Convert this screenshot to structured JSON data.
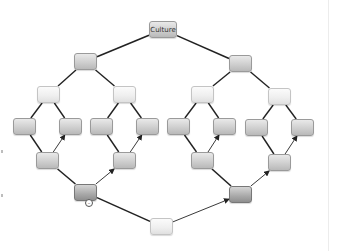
{
  "diagram": {
    "type": "tree",
    "root": {
      "id": "culture",
      "label": "Culture"
    },
    "nodes": [
      {
        "id": "culture",
        "label": "Culture",
        "x": 149,
        "y": 21,
        "style": "root"
      },
      {
        "id": "l1a",
        "label": "",
        "x": 74,
        "y": 53,
        "style": "normal"
      },
      {
        "id": "l1b",
        "label": "",
        "x": 229,
        "y": 55,
        "style": "normal"
      },
      {
        "id": "l2a",
        "label": "",
        "x": 37,
        "y": 86,
        "style": "light"
      },
      {
        "id": "l2b",
        "label": "",
        "x": 113,
        "y": 86,
        "style": "light"
      },
      {
        "id": "l2c",
        "label": "",
        "x": 191,
        "y": 86,
        "style": "light"
      },
      {
        "id": "l2d",
        "label": "",
        "x": 268,
        "y": 88,
        "style": "light"
      },
      {
        "id": "l3a",
        "label": "",
        "x": 13,
        "y": 118,
        "style": "normal"
      },
      {
        "id": "l3b",
        "label": "",
        "x": 59,
        "y": 118,
        "style": "normal"
      },
      {
        "id": "l3c",
        "label": "",
        "x": 90,
        "y": 118,
        "style": "normal"
      },
      {
        "id": "l3d",
        "label": "",
        "x": 136,
        "y": 118,
        "style": "normal"
      },
      {
        "id": "l3e",
        "label": "",
        "x": 167,
        "y": 118,
        "style": "normal"
      },
      {
        "id": "l3f",
        "label": "",
        "x": 213,
        "y": 118,
        "style": "normal"
      },
      {
        "id": "l3g",
        "label": "",
        "x": 245,
        "y": 119,
        "style": "normal"
      },
      {
        "id": "l3h",
        "label": "",
        "x": 291,
        "y": 119,
        "style": "normal"
      },
      {
        "id": "l4a",
        "label": "",
        "x": 36,
        "y": 152,
        "style": "normal"
      },
      {
        "id": "l4b",
        "label": "",
        "x": 113,
        "y": 152,
        "style": "normal"
      },
      {
        "id": "l4c",
        "label": "",
        "x": 191,
        "y": 152,
        "style": "normal"
      },
      {
        "id": "l4d",
        "label": "",
        "x": 268,
        "y": 154,
        "style": "normal"
      },
      {
        "id": "l5a",
        "label": "",
        "x": 74,
        "y": 184,
        "style": "dark"
      },
      {
        "id": "l5b",
        "label": "",
        "x": 229,
        "y": 186,
        "style": "dark"
      },
      {
        "id": "bottom",
        "label": "",
        "x": 150,
        "y": 218,
        "style": "light"
      }
    ],
    "edges": [
      {
        "from": "culture",
        "to": "l1a",
        "arrow": false,
        "weight": 1.6
      },
      {
        "from": "culture",
        "to": "l1b",
        "arrow": false,
        "weight": 1.6
      },
      {
        "from": "l1a",
        "to": "l2a",
        "arrow": false,
        "weight": 1.4
      },
      {
        "from": "l1a",
        "to": "l2b",
        "arrow": false,
        "weight": 1.4
      },
      {
        "from": "l1b",
        "to": "l2c",
        "arrow": false,
        "weight": 1.4
      },
      {
        "from": "l1b",
        "to": "l2d",
        "arrow": false,
        "weight": 1.4
      },
      {
        "from": "l2a",
        "to": "l3a",
        "arrow": false,
        "weight": 1.4
      },
      {
        "from": "l2a",
        "to": "l3b",
        "arrow": false,
        "weight": 1.4
      },
      {
        "from": "l2b",
        "to": "l3c",
        "arrow": false,
        "weight": 1.4
      },
      {
        "from": "l2b",
        "to": "l3d",
        "arrow": false,
        "weight": 1.4
      },
      {
        "from": "l2c",
        "to": "l3e",
        "arrow": false,
        "weight": 1.4
      },
      {
        "from": "l2c",
        "to": "l3f",
        "arrow": false,
        "weight": 1.4
      },
      {
        "from": "l2d",
        "to": "l3g",
        "arrow": false,
        "weight": 1.4
      },
      {
        "from": "l2d",
        "to": "l3h",
        "arrow": false,
        "weight": 1.4
      },
      {
        "from": "l3a",
        "to": "l4a",
        "arrow": false,
        "weight": 1.4
      },
      {
        "from": "l4a",
        "to": "l3b",
        "arrow": true,
        "weight": 0.9
      },
      {
        "from": "l3c",
        "to": "l4b",
        "arrow": false,
        "weight": 1.4
      },
      {
        "from": "l4b",
        "to": "l3d",
        "arrow": true,
        "weight": 0.9
      },
      {
        "from": "l3e",
        "to": "l4c",
        "arrow": false,
        "weight": 1.4
      },
      {
        "from": "l4c",
        "to": "l3f",
        "arrow": true,
        "weight": 0.9
      },
      {
        "from": "l3g",
        "to": "l4d",
        "arrow": false,
        "weight": 1.4
      },
      {
        "from": "l4d",
        "to": "l3h",
        "arrow": true,
        "weight": 0.9
      },
      {
        "from": "l4a",
        "to": "l5a",
        "arrow": false,
        "weight": 1.6
      },
      {
        "from": "l5a",
        "to": "l4b",
        "arrow": true,
        "weight": 0.9
      },
      {
        "from": "l4c",
        "to": "l5b",
        "arrow": false,
        "weight": 1.6
      },
      {
        "from": "l5b",
        "to": "l4d",
        "arrow": true,
        "weight": 0.9
      },
      {
        "from": "l5a",
        "to": "bottom",
        "arrow": false,
        "weight": 1.6
      },
      {
        "from": "bottom",
        "to": "l5b",
        "arrow": true,
        "weight": 0.9
      }
    ],
    "collapse_toggle": {
      "node": "l5a",
      "glyph": "–",
      "x": 85,
      "y": 199
    }
  }
}
